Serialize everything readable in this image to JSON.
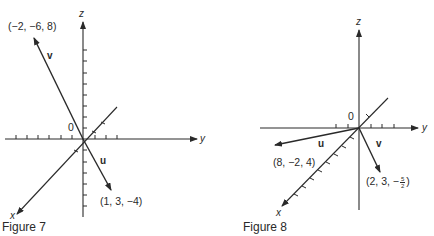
{
  "figures": [
    {
      "caption": "Figure 7",
      "axes": {
        "x": "x",
        "y": "y",
        "z": "z"
      },
      "origin_label": "0",
      "vectors": [
        {
          "name": "v",
          "point": "(−2, −6, 8)",
          "components": [
            -2,
            -6,
            8
          ]
        },
        {
          "name": "u",
          "point": "(1, 3, −4)",
          "components": [
            1,
            3,
            -4
          ]
        }
      ]
    },
    {
      "caption": "Figure 8",
      "axes": {
        "x": "x",
        "y": "y",
        "z": "z"
      },
      "origin_label": "0",
      "vectors": [
        {
          "name": "u",
          "point": "(8, −2, 4)",
          "components": [
            8,
            -2,
            4
          ]
        },
        {
          "name": "v",
          "point_prefix": "(2, 3, −",
          "frac_num": "5",
          "frac_den": "2",
          "point_suffix": ")",
          "components": [
            2,
            3,
            -2.5
          ]
        }
      ]
    }
  ],
  "colors": {
    "ink": "#2a2a2a",
    "background": "#ffffff"
  }
}
